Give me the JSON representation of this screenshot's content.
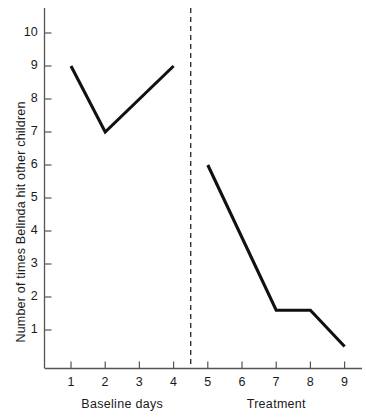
{
  "chart_data": {
    "type": "line",
    "title": "",
    "xlabel": "",
    "ylabel": "Number of times Belinda hit other children",
    "xlim": [
      0.5,
      9.8
    ],
    "ylim": [
      0,
      10.8
    ],
    "grid": false,
    "legend": false,
    "x_ticks": [
      1,
      2,
      3,
      4,
      5,
      6,
      7,
      8,
      9
    ],
    "x_tick_labels": [
      "1",
      "2",
      "3",
      "4",
      "5",
      "6",
      "7",
      "8",
      "9"
    ],
    "y_ticks": [
      1,
      2,
      3,
      4,
      5,
      6,
      7,
      8,
      9,
      10
    ],
    "y_tick_labels": [
      "1",
      "2",
      "3",
      "4",
      "5",
      "6",
      "7",
      "8",
      "9",
      "10"
    ],
    "phase_line_x": 4.5,
    "phase_line_style": "dashed",
    "phase_labels": [
      {
        "text": "Baseline days",
        "center_x": 2.5
      },
      {
        "text": "Treatment",
        "center_x": 7.0
      }
    ],
    "series": [
      {
        "name": "Baseline days",
        "points": [
          {
            "x": 1,
            "y": 9
          },
          {
            "x": 2,
            "y": 7
          },
          {
            "x": 4,
            "y": 9
          }
        ]
      },
      {
        "name": "Treatment",
        "points": [
          {
            "x": 5,
            "y": 6
          },
          {
            "x": 7,
            "y": 1.6
          },
          {
            "x": 8,
            "y": 1.6
          },
          {
            "x": 9,
            "y": 0.5
          }
        ]
      }
    ],
    "line_color": "#111111",
    "axis_color": "#555555"
  }
}
